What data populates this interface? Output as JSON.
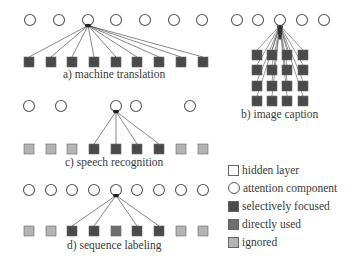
{
  "colors": {
    "hidden": "#ffffff",
    "selective": "#4a4a4a",
    "direct": "#6e6e6e",
    "ignored": "#b4b4b4",
    "stroke": "#555555",
    "line": "#555555"
  },
  "panels": {
    "a": {
      "label": "a) machine translation",
      "circles_y": 20,
      "circles_x": [
        30,
        59,
        88,
        116,
        145,
        174,
        202
      ],
      "focus_x": 88,
      "squares_y": 62,
      "squares": [
        {
          "x": 29,
          "type": "selective"
        },
        {
          "x": 51,
          "type": "selective"
        },
        {
          "x": 72,
          "type": "selective"
        },
        {
          "x": 94,
          "type": "selective"
        },
        {
          "x": 116,
          "type": "selective"
        },
        {
          "x": 137,
          "type": "selective"
        },
        {
          "x": 159,
          "type": "selective"
        },
        {
          "x": 181,
          "type": "selective"
        },
        {
          "x": 203,
          "type": "selective"
        }
      ]
    },
    "b": {
      "label": "b) image caption",
      "circles_y": 20,
      "circles_x": [
        237,
        258,
        280,
        302,
        324
      ],
      "focus_x": 280,
      "grid_cols": [
        257,
        272,
        287,
        303
      ],
      "grid_rows": [
        55,
        70,
        86,
        101
      ],
      "type": "selective"
    },
    "c": {
      "label": "c) speech recognition",
      "circles_y": 106,
      "circles_x": [
        29,
        61,
        116,
        136,
        190
      ],
      "focus_x": 116,
      "squares_y": 149,
      "squares": [
        {
          "x": 29,
          "type": "ignored"
        },
        {
          "x": 51,
          "type": "ignored"
        },
        {
          "x": 72,
          "type": "ignored"
        },
        {
          "x": 94,
          "type": "selective"
        },
        {
          "x": 116,
          "type": "selective"
        },
        {
          "x": 137,
          "type": "selective"
        },
        {
          "x": 159,
          "type": "selective"
        },
        {
          "x": 181,
          "type": "ignored"
        },
        {
          "x": 203,
          "type": "ignored"
        }
      ]
    },
    "d": {
      "label": "d) sequence labeling",
      "circles_y": 190,
      "circles_x": [
        29,
        51,
        72,
        94,
        116,
        137,
        159,
        181,
        203
      ],
      "focus_x": 116,
      "squares_y": 231,
      "squares": [
        {
          "x": 29,
          "type": "ignored"
        },
        {
          "x": 51,
          "type": "ignored"
        },
        {
          "x": 72,
          "type": "selective"
        },
        {
          "x": 94,
          "type": "selective"
        },
        {
          "x": 116,
          "type": "direct"
        },
        {
          "x": 137,
          "type": "selective"
        },
        {
          "x": 159,
          "type": "selective"
        },
        {
          "x": 181,
          "type": "ignored"
        },
        {
          "x": 203,
          "type": "ignored"
        }
      ]
    }
  },
  "legend": {
    "items": [
      {
        "label": "hidden layer",
        "shape": "square",
        "type": "hidden"
      },
      {
        "label": "attention component",
        "shape": "circle",
        "type": "hidden"
      },
      {
        "label": "selectively focused",
        "shape": "square",
        "type": "selective"
      },
      {
        "label": "directly used",
        "shape": "square",
        "type": "direct"
      },
      {
        "label": "ignored",
        "shape": "square",
        "type": "ignored"
      }
    ]
  }
}
